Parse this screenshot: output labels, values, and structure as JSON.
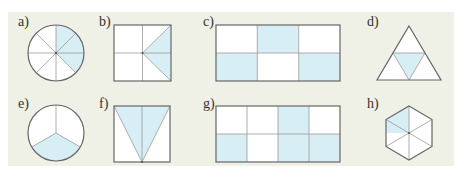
{
  "colors": {
    "panel_background": "#eff0e6",
    "shape_fill": "#ffffff",
    "shaded_fill": "#d8eef5",
    "outline": "#666666",
    "divider": "#9a9a9a"
  },
  "figures": [
    {
      "label": "a)",
      "shape": "circle",
      "divisions": 8,
      "shaded": 3,
      "description": "circle in 8 equal sectors, 3 shaded (right side)"
    },
    {
      "label": "b)",
      "shape": "square",
      "description": "square with quadrant lines and a triangle from center to right corners shaded"
    },
    {
      "label": "c)",
      "shape": "rectangle",
      "rows": 2,
      "cols": 3,
      "shaded_cells": [
        [
          0,
          1
        ],
        [
          1,
          0
        ],
        [
          1,
          2
        ]
      ]
    },
    {
      "label": "d)",
      "shape": "triangle",
      "divisions": 4,
      "shaded": 1,
      "description": "triangle in 4 smaller triangles, middle one shaded"
    },
    {
      "label": "e)",
      "shape": "circle",
      "divisions": 3,
      "shaded": 1,
      "description": "circle in 3 sectors, bottom sector shaded"
    },
    {
      "label": "f)",
      "shape": "square",
      "description": "square with inverted triangle from top corners to bottom center shaded, split by vertical line"
    },
    {
      "label": "g)",
      "shape": "rectangle",
      "rows": 2,
      "cols": 4,
      "shaded_cells": [
        [
          0,
          2
        ],
        [
          1,
          0
        ],
        [
          1,
          2
        ],
        [
          1,
          3
        ]
      ]
    },
    {
      "label": "h)",
      "shape": "hexagon",
      "divisions": 6,
      "shaded": 1,
      "description": "hexagon in 6 triangles, upper-left one shaded"
    }
  ]
}
